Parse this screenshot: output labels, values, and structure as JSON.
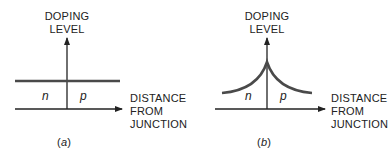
{
  "diagrams": [
    {
      "id": "a",
      "y_axis_label": [
        "DOPING",
        "LEVEL"
      ],
      "x_axis_label": [
        "DISTANCE",
        "FROM",
        "JUNCTION"
      ],
      "left_region": "n",
      "right_region": "p",
      "caption_open": "(",
      "caption_letter": "a",
      "caption_close": ")",
      "profile": "uniform (step junction)"
    },
    {
      "id": "b",
      "y_axis_label": [
        "DOPING",
        "LEVEL"
      ],
      "x_axis_label": [
        "DISTANCE",
        "FROM",
        "JUNCTION"
      ],
      "left_region": "n",
      "right_region": "p",
      "caption_open": "(",
      "caption_letter": "b",
      "caption_close": ")",
      "profile": "peaked at junction, decaying with distance"
    }
  ],
  "colors": {
    "curve": "#4a4a4a",
    "axis": "#222222"
  }
}
